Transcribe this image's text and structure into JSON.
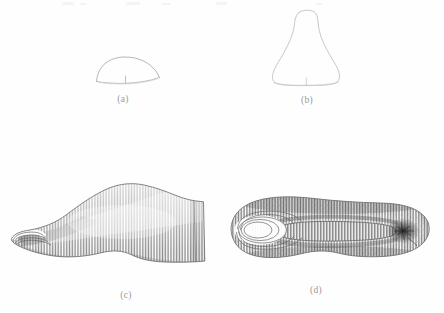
{
  "figure": {
    "type": "technical-illustration",
    "background_color": "#fefefe",
    "line_color": "#8f8f8f",
    "caption_color": "#9a9a9a",
    "panel_count": 4
  },
  "panels": [
    {
      "id": "a",
      "label": "(a)",
      "view": "cross-section-dome-outline",
      "description": "small semi-elliptical dome outline with short vertical centre tick at the base",
      "rendering": "outline only, no shading",
      "position": {
        "left": 88,
        "top": 50,
        "width": 80,
        "height": 42
      }
    },
    {
      "id": "b",
      "label": "(b)",
      "view": "bell-shaped-outline",
      "description": "tall bell / trapezoid outline, narrow rounded top flaring to a wide flat base with short vertical centre tick",
      "rendering": "outline only, no shading",
      "position": {
        "left": 258,
        "top": 4,
        "width": 96,
        "height": 90
      }
    },
    {
      "id": "c",
      "label": "(c)",
      "view": "side-elevation",
      "description": "lateral profile of the shoe last, pointed toe at left, squared heel block at right, dense vertical hatching across the surface and concentric contour rings at the toe tip",
      "rendering": "line-hatched shaded engraving",
      "position": {
        "left": 4,
        "top": 176,
        "width": 222,
        "height": 108
      }
    },
    {
      "id": "d",
      "label": "(d)",
      "view": "plan-bottom",
      "description": "plan view of the shoe last, elongated oval, concentric contour rings at the toe end on the left, vertically hatched central channel, dark concentrated mark near the heel on the right",
      "rendering": "line-hatched shaded engraving",
      "position": {
        "left": 218,
        "top": 180,
        "width": 222,
        "height": 100
      }
    }
  ]
}
